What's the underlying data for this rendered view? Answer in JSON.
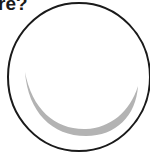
{
  "question": {
    "text_fragment": "re?"
  },
  "figure": {
    "outline_color": "#1a1a1a",
    "crescent_color": "#b3b3b3"
  }
}
